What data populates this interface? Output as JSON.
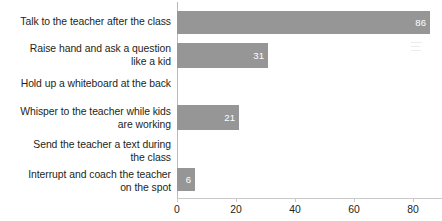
{
  "chart_data": {
    "type": "bar",
    "orientation": "horizontal",
    "title": "",
    "subtitle": "",
    "xlabel": "",
    "ylabel": "",
    "categories": [
      "Talk to the teacher after the class",
      "Raise hand and ask a question like a kid",
      "Hold up a whiteboard at the back",
      "Whisper to the teacher while kids are working",
      "Send the teacher a text during the class",
      "Interrupt and coach the teacher on the spot"
    ],
    "values": [
      86,
      31,
      0,
      21,
      0,
      6
    ],
    "data_labels": [
      "86",
      "31",
      "",
      "21",
      "",
      "6"
    ],
    "xlim": [
      0,
      90
    ],
    "xticks": [
      0,
      20,
      40,
      60,
      80
    ],
    "xtick_labels": [
      "0",
      "20",
      "40",
      "60",
      "80"
    ],
    "grid": false,
    "legend": false,
    "bar_color": "#969696",
    "label_text_color": "#ffffff",
    "axis_text_color": "#231f20",
    "axis_line_color": "#c9c9c9",
    "background_color": "#ffffff"
  },
  "category_lines": [
    [
      "Talk to the teacher after the class"
    ],
    [
      "Raise hand and ask a question",
      "like a kid"
    ],
    [
      "Hold up a whiteboard at the back"
    ],
    [
      "Whisper to the teacher while kids",
      "are working"
    ],
    [
      "Send the teacher a text during",
      "the class"
    ],
    [
      "Interrupt and coach the teacher",
      "on the spot"
    ]
  ]
}
